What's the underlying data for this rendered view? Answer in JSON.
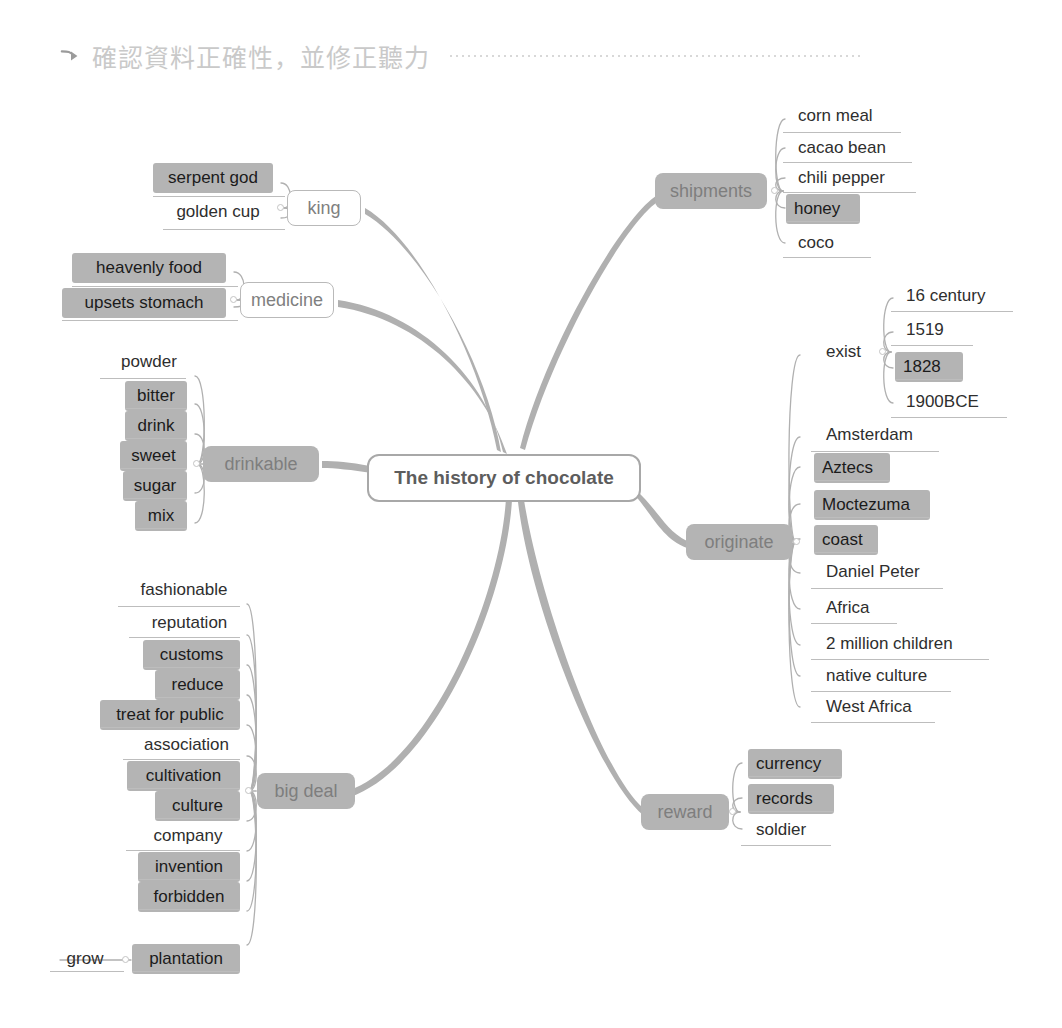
{
  "header": {
    "arrow_icon": "arrow-right-curve-icon",
    "text": "確認資料正確性，並修正聽力"
  },
  "colors": {
    "highlight": "#b4b4b4",
    "node_fill": "#b4b4b4",
    "branch_line": "#b0b0b0",
    "leaf_underline": "#bdbdbd",
    "root_border": "#a8a8a8",
    "text": "#2e2e2e",
    "header_text": "#c9c9c9"
  },
  "mindmap": {
    "root": {
      "label": "The history of chocolate"
    },
    "branches": [
      {
        "id": "king",
        "label": "king",
        "side": "left",
        "style": "outline",
        "children": [
          {
            "label": "serpent god",
            "highlight": true
          },
          {
            "label": "golden cup",
            "highlight": false
          }
        ]
      },
      {
        "id": "medicine",
        "label": "medicine",
        "side": "left",
        "style": "outline",
        "children": [
          {
            "label": "heavenly food",
            "highlight": true
          },
          {
            "label": "upsets stomach",
            "highlight": true
          }
        ]
      },
      {
        "id": "drinkable",
        "label": "drinkable",
        "side": "left",
        "style": "filled",
        "children": [
          {
            "label": "powder",
            "highlight": false
          },
          {
            "label": "bitter",
            "highlight": true
          },
          {
            "label": "drink",
            "highlight": true
          },
          {
            "label": "sweet",
            "highlight": true
          },
          {
            "label": "sugar",
            "highlight": true
          },
          {
            "label": "mix",
            "highlight": true
          }
        ]
      },
      {
        "id": "big-deal",
        "label": "big deal",
        "side": "left",
        "style": "filled",
        "children": [
          {
            "label": "fashionable",
            "highlight": false
          },
          {
            "label": "reputation",
            "highlight": false
          },
          {
            "label": "customs",
            "highlight": true
          },
          {
            "label": "reduce",
            "highlight": true
          },
          {
            "label": "treat for public",
            "highlight": true
          },
          {
            "label": "association",
            "highlight": false
          },
          {
            "label": "cultivation",
            "highlight": true
          },
          {
            "label": "culture",
            "highlight": true
          },
          {
            "label": "company",
            "highlight": false
          },
          {
            "label": "invention",
            "highlight": true
          },
          {
            "label": "forbidden",
            "highlight": true
          },
          {
            "label": "plantation",
            "highlight": true,
            "children": [
              {
                "label": "grow",
                "highlight": false
              }
            ]
          }
        ]
      },
      {
        "id": "shipments",
        "label": "shipments",
        "side": "right",
        "style": "filled",
        "children": [
          {
            "label": "corn meal",
            "highlight": false
          },
          {
            "label": "cacao bean",
            "highlight": false
          },
          {
            "label": "chili pepper",
            "highlight": false
          },
          {
            "label": "honey",
            "highlight": true
          },
          {
            "label": "coco",
            "highlight": false
          }
        ]
      },
      {
        "id": "originate",
        "label": "originate",
        "side": "right",
        "style": "filled",
        "children": [
          {
            "label": "exist",
            "highlight": false,
            "children": [
              {
                "label": "16 century",
                "highlight": false
              },
              {
                "label": "1519",
                "highlight": false
              },
              {
                "label": "1828",
                "highlight": true
              },
              {
                "label": "1900BCE",
                "highlight": false
              }
            ]
          },
          {
            "label": "Amsterdam",
            "highlight": false
          },
          {
            "label": "Aztecs",
            "highlight": true
          },
          {
            "label": "Moctezuma",
            "highlight": true
          },
          {
            "label": "coast",
            "highlight": true
          },
          {
            "label": "Daniel Peter",
            "highlight": false
          },
          {
            "label": "Africa",
            "highlight": false
          },
          {
            "label": "2 million children",
            "highlight": false
          },
          {
            "label": "native culture",
            "highlight": false
          },
          {
            "label": "West Africa",
            "highlight": false
          }
        ]
      },
      {
        "id": "reward",
        "label": "reward",
        "side": "right",
        "style": "filled",
        "children": [
          {
            "label": "currency",
            "highlight": true
          },
          {
            "label": "records",
            "highlight": true
          },
          {
            "label": "soldier",
            "highlight": false
          }
        ]
      }
    ]
  }
}
